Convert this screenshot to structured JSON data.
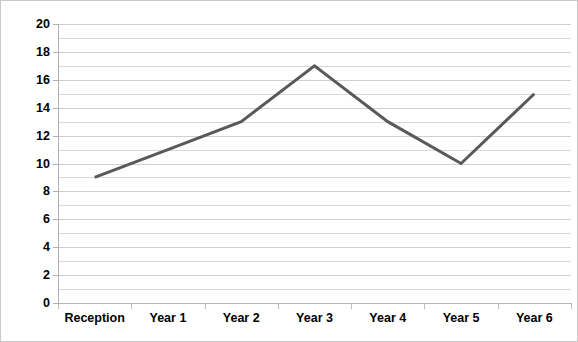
{
  "chart_data": {
    "type": "line",
    "title": "",
    "subtitle": "",
    "xlabel": "",
    "ylabel": "",
    "categories": [
      "Reception",
      "Year 1",
      "Year 2",
      "Year 3",
      "Year 4",
      "Year 5",
      "Year 6"
    ],
    "values": [
      9,
      11,
      13,
      17,
      13,
      10,
      15
    ],
    "series": [
      {
        "name": "Series 1",
        "values": [
          9,
          11,
          13,
          17,
          13,
          10,
          15
        ]
      }
    ],
    "ylim": [
      0,
      20
    ],
    "y_tick_labels": [
      "0",
      "2",
      "4",
      "6",
      "8",
      "10",
      "12",
      "14",
      "16",
      "18",
      "20"
    ],
    "y_tick_values": [
      0,
      2,
      4,
      6,
      8,
      10,
      12,
      14,
      16,
      18,
      20
    ],
    "y_tick_step": 2,
    "gridline_step": 1,
    "grid": true,
    "grid_axis": "y",
    "legend": "none",
    "markers": "none",
    "colors": {
      "line": "#595959",
      "gridline": "#d9d9d9",
      "gridline_major": "#cfcfcf",
      "axis": "#b6b6b6",
      "text": "#000000",
      "background": "#ffffff",
      "border": "#c8c8c8"
    },
    "line_width_px": 3
  }
}
